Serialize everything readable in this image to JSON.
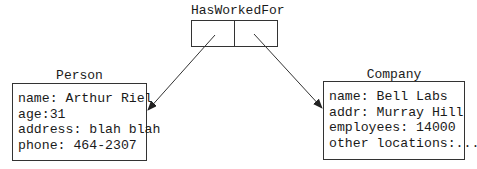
{
  "relationship": {
    "title": "HasWorkedFor",
    "cells": [
      "",
      ""
    ]
  },
  "person": {
    "title": "Person",
    "fields": [
      "name: Arthur Riel",
      "age:31",
      "address: blah blah",
      "phone: 464-2307"
    ]
  },
  "company": {
    "title": "Company",
    "fields": [
      "name: Bell Labs",
      "addr: Murray Hill",
      "employees: 14000",
      "other locations:..."
    ]
  },
  "colors": {
    "line": "#333333",
    "text": "#1a1a1a",
    "background": "#ffffff"
  }
}
